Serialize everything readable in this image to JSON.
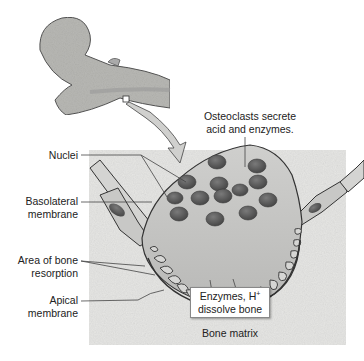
{
  "figure": {
    "title_callout": {
      "line1": "Osteoclasts secrete",
      "line2": "acid and enzymes."
    },
    "labels": {
      "nuclei": "Nuclei",
      "basolateral": {
        "line1": "Basolateral",
        "line2": "membrane"
      },
      "resorption": {
        "line1": "Area of bone",
        "line2": "resorption"
      },
      "apical": {
        "line1": "Apical",
        "line2": "membrane"
      },
      "bone_matrix": "Bone matrix"
    },
    "box": {
      "line1": "Enzymes, H",
      "sup": "+",
      "line2": "dissolve bone"
    },
    "colors": {
      "bone_matrix_bg": "#e6e6e4",
      "bone_fill": "#b8b8b4",
      "cell_fill": "#c4c4c2",
      "nucleus": "#5a5a5a",
      "outline": "#3a3a3a",
      "ruffled": "#777777"
    }
  }
}
